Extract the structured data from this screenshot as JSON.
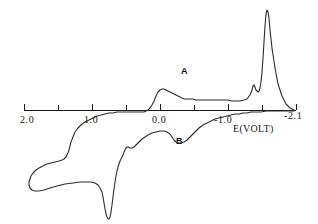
{
  "chart_data": {
    "type": "line",
    "title": "",
    "subtitle": "",
    "xlabel": "E(VOLT)",
    "ylabel": "",
    "xlim": [
      2.0,
      -2.1
    ],
    "ylim": [
      -1.0,
      1.0
    ],
    "grid": false,
    "legend_position": "none",
    "axis_style": "single-horizontal-axis-with-ticks",
    "tick_labels": [
      {
        "text": "2.0",
        "value": 2.0,
        "x_px": 24
      },
      {
        "text": "1.0",
        "value": 1.0,
        "x_px": 76
      },
      {
        "text": "0.0",
        "value": 0.0,
        "x_px": 155
      },
      {
        "text": "-1.0",
        "value": -1.0,
        "x_px": 211
      },
      {
        "text": "-2.1",
        "value": -2.1,
        "x_px": 289
      }
    ],
    "minor_ticks": [
      1.5,
      0.5,
      -0.5,
      -1.5
    ],
    "annotations": [
      {
        "text": "A",
        "x_px": 184,
        "y_px": 72,
        "note": "anodic/return peak marker upper branch"
      },
      {
        "text": "B",
        "x_px": 178,
        "y_px": 142,
        "note": "cathodic peak marker lower branch"
      }
    ],
    "series": [
      {
        "name": "cyclic voltammogram cycle",
        "color": "#2b2b2b",
        "description": "Cyclic voltammogram: forward cathodic sweep from +2.0 V to -2.1 V and reverse anodic sweep back, with reversible couple A/B near -0.45 V and large irreversible response near -1.9 V",
        "points_px": [
          [
            294,
            110
          ],
          [
            290,
            108
          ],
          [
            286,
            104
          ],
          [
            282,
            96
          ],
          [
            278,
            84
          ],
          [
            275,
            68
          ],
          [
            272,
            48
          ],
          [
            270,
            30
          ],
          [
            269,
            18
          ],
          [
            268,
            12
          ],
          [
            267,
            10
          ],
          [
            266,
            14
          ],
          [
            265,
            26
          ],
          [
            264,
            42
          ],
          [
            263,
            58
          ],
          [
            262,
            72
          ],
          [
            261,
            82
          ],
          [
            260,
            88
          ],
          [
            259,
            91
          ],
          [
            258,
            92
          ],
          [
            256,
            90
          ],
          [
            255,
            87
          ],
          [
            254,
            85
          ],
          [
            253,
            86
          ],
          [
            252,
            90
          ],
          [
            250,
            95
          ],
          [
            247,
            99
          ],
          [
            244,
            100
          ],
          [
            240,
            101
          ],
          [
            236,
            101
          ],
          [
            232,
            101
          ],
          [
            228,
            100
          ],
          [
            224,
            100
          ],
          [
            220,
            100
          ],
          [
            216,
            100
          ],
          [
            212,
            100
          ],
          [
            208,
            100
          ],
          [
            204,
            100
          ],
          [
            200,
            100
          ],
          [
            196,
            100
          ],
          [
            193,
            99
          ],
          [
            190,
            99
          ],
          [
            187,
            99
          ],
          [
            184,
            99
          ],
          [
            182,
            98
          ],
          [
            180,
            97
          ],
          [
            178,
            96
          ],
          [
            176,
            95
          ],
          [
            174,
            94
          ],
          [
            172,
            93
          ],
          [
            170,
            92
          ],
          [
            168,
            91
          ],
          [
            166,
            90
          ],
          [
            164,
            89
          ],
          [
            162,
            89
          ],
          [
            160,
            90
          ],
          [
            158,
            92
          ],
          [
            156,
            96
          ],
          [
            154,
            101
          ],
          [
            152,
            105
          ],
          [
            150,
            108
          ],
          [
            148,
            110
          ],
          [
            146,
            111
          ],
          [
            144,
            112
          ],
          [
            141,
            112
          ],
          [
            137,
            112
          ],
          [
            133,
            112
          ],
          [
            129,
            112
          ],
          [
            125,
            112
          ],
          [
            121,
            112
          ],
          [
            117,
            112
          ],
          [
            113,
            113
          ],
          [
            109,
            113
          ],
          [
            105,
            114
          ],
          [
            101,
            115
          ],
          [
            97,
            116
          ],
          [
            93,
            118
          ],
          [
            89,
            120
          ],
          [
            85,
            122
          ],
          [
            81,
            125
          ],
          [
            78,
            128
          ],
          [
            75,
            132
          ],
          [
            73,
            137
          ],
          [
            71,
            142
          ],
          [
            70,
            146
          ],
          [
            69,
            150
          ],
          [
            68,
            153
          ],
          [
            67,
            155
          ],
          [
            66,
            157
          ],
          [
            65,
            158
          ],
          [
            64,
            159
          ],
          [
            62,
            160
          ],
          [
            59,
            161
          ],
          [
            55,
            162
          ],
          [
            51,
            163
          ],
          [
            47,
            164
          ],
          [
            43,
            166
          ],
          [
            39,
            168
          ],
          [
            36,
            170
          ],
          [
            33,
            173
          ],
          [
            31,
            176
          ],
          [
            30,
            179
          ],
          [
            29,
            182
          ],
          [
            29,
            185
          ],
          [
            30,
            188
          ],
          [
            32,
            190
          ],
          [
            35,
            191
          ],
          [
            39,
            191
          ],
          [
            44,
            190
          ],
          [
            50,
            188
          ],
          [
            57,
            186
          ],
          [
            65,
            184
          ],
          [
            73,
            183
          ],
          [
            80,
            182
          ],
          [
            86,
            182
          ],
          [
            91,
            182
          ],
          [
            95,
            183
          ],
          [
            98,
            185
          ],
          [
            100,
            188
          ],
          [
            102,
            192
          ],
          [
            103,
            197
          ],
          [
            104,
            203
          ],
          [
            105,
            209
          ],
          [
            106,
            214
          ],
          [
            107,
            217
          ],
          [
            108,
            219
          ],
          [
            109,
            219
          ],
          [
            110,
            217
          ],
          [
            111,
            212
          ],
          [
            112,
            205
          ],
          [
            113,
            197
          ],
          [
            114,
            189
          ],
          [
            115,
            182
          ],
          [
            116,
            176
          ],
          [
            117,
            171
          ],
          [
            118,
            167
          ],
          [
            119,
            164
          ],
          [
            120,
            161
          ],
          [
            121,
            159
          ],
          [
            122,
            157
          ],
          [
            123,
            155
          ],
          [
            124,
            152
          ],
          [
            125,
            150
          ],
          [
            126,
            148
          ],
          [
            127,
            147
          ],
          [
            128,
            147
          ],
          [
            130,
            148
          ],
          [
            132,
            148
          ],
          [
            134,
            147
          ],
          [
            136,
            145
          ],
          [
            138,
            143
          ],
          [
            140,
            141
          ],
          [
            142,
            139
          ],
          [
            145,
            137
          ],
          [
            148,
            135
          ],
          [
            152,
            133
          ],
          [
            156,
            132
          ],
          [
            160,
            131
          ],
          [
            164,
            131
          ],
          [
            167,
            132
          ],
          [
            170,
            134
          ],
          [
            172,
            137
          ],
          [
            174,
            140
          ],
          [
            176,
            142
          ],
          [
            178,
            143
          ],
          [
            181,
            143
          ],
          [
            184,
            142
          ],
          [
            187,
            140
          ],
          [
            190,
            137
          ],
          [
            193,
            134
          ],
          [
            196,
            131
          ],
          [
            199,
            128
          ],
          [
            203,
            125
          ],
          [
            207,
            123
          ],
          [
            211,
            121
          ],
          [
            215,
            119
          ],
          [
            219,
            118
          ],
          [
            223,
            117
          ],
          [
            227,
            116
          ],
          [
            231,
            115
          ],
          [
            235,
            114
          ],
          [
            239,
            114
          ],
          [
            243,
            113
          ],
          [
            247,
            113
          ],
          [
            251,
            112
          ],
          [
            256,
            112
          ],
          [
            261,
            112
          ],
          [
            266,
            111
          ],
          [
            271,
            111
          ],
          [
            276,
            111
          ],
          [
            281,
            111
          ],
          [
            286,
            111
          ],
          [
            290,
            111
          ],
          [
            294,
            111
          ]
        ]
      }
    ],
    "key_features": [
      {
        "label": "A",
        "type": "peak",
        "branch": "upper",
        "approx_potential": -0.45
      },
      {
        "label": "B",
        "type": "peak",
        "branch": "lower",
        "approx_potential": -0.4
      },
      {
        "label": "large reduction wave",
        "branch": "upper",
        "approx_potential": -2.0
      },
      {
        "label": "sharp stripping peak",
        "branch": "lower",
        "approx_potential": 0.75
      }
    ]
  },
  "axis": {
    "line_y_px": 110,
    "x_start_px": 24,
    "x_end_px": 296,
    "tick_length_px": 6,
    "color": "#1a1a1a"
  },
  "colors": {
    "background": "#ffffff",
    "curve": "#2b2b2b",
    "axis": "#1a1a1a",
    "text": "#111111"
  }
}
